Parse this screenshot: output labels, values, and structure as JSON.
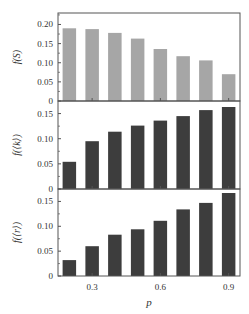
{
  "chart_data": [
    {
      "type": "bar",
      "panel": "top",
      "ylabel": "f(S)",
      "xlabel": "",
      "x": [
        0.2,
        0.3,
        0.4,
        0.5,
        0.6,
        0.7,
        0.8,
        0.9
      ],
      "values": [
        0.19,
        0.188,
        0.178,
        0.163,
        0.136,
        0.117,
        0.106,
        0.07
      ],
      "ylim": [
        0,
        0.23
      ],
      "yticks": [
        0,
        0.05,
        0.1,
        0.15,
        0.2
      ],
      "ytick_labels": [
        "0",
        "0.05",
        "0.10",
        "0.15",
        "0.20"
      ],
      "bar_color": "#a6a6a6",
      "grid": false
    },
    {
      "type": "bar",
      "panel": "middle",
      "ylabel": "f(⟨k⟩)",
      "xlabel": "",
      "x": [
        0.2,
        0.3,
        0.4,
        0.5,
        0.6,
        0.7,
        0.8,
        0.9
      ],
      "values": [
        0.054,
        0.095,
        0.114,
        0.126,
        0.136,
        0.145,
        0.157,
        0.163
      ],
      "ylim": [
        0,
        0.175
      ],
      "yticks": [
        0,
        0.05,
        0.1,
        0.15
      ],
      "ytick_labels": [
        "0",
        "0.05",
        "0.10",
        "0.15"
      ],
      "bar_color": "#3d3d3d",
      "grid": false
    },
    {
      "type": "bar",
      "panel": "bottom",
      "ylabel": "f(⟨r⟩)",
      "xlabel": "p",
      "x": [
        0.2,
        0.3,
        0.4,
        0.5,
        0.6,
        0.7,
        0.8,
        0.9
      ],
      "values": [
        0.032,
        0.06,
        0.083,
        0.094,
        0.111,
        0.134,
        0.147,
        0.167
      ],
      "ylim": [
        0,
        0.175
      ],
      "yticks": [
        0,
        0.05,
        0.1,
        0.15
      ],
      "ytick_labels": [
        "0",
        "0.05",
        "0.10",
        "0.15"
      ],
      "xticks": [
        0.3,
        0.6,
        0.9
      ],
      "xtick_labels": [
        "0.3",
        "0.6",
        "0.9"
      ],
      "bar_color": "#3d3d3d",
      "grid": false
    }
  ],
  "layout": {
    "plot_left": 58,
    "plot_right": 240,
    "panels": [
      {
        "top": 13,
        "bottom": 101
      },
      {
        "top": 101,
        "bottom": 189
      },
      {
        "top": 189,
        "bottom": 276
      }
    ],
    "axis_color": "#555555"
  }
}
